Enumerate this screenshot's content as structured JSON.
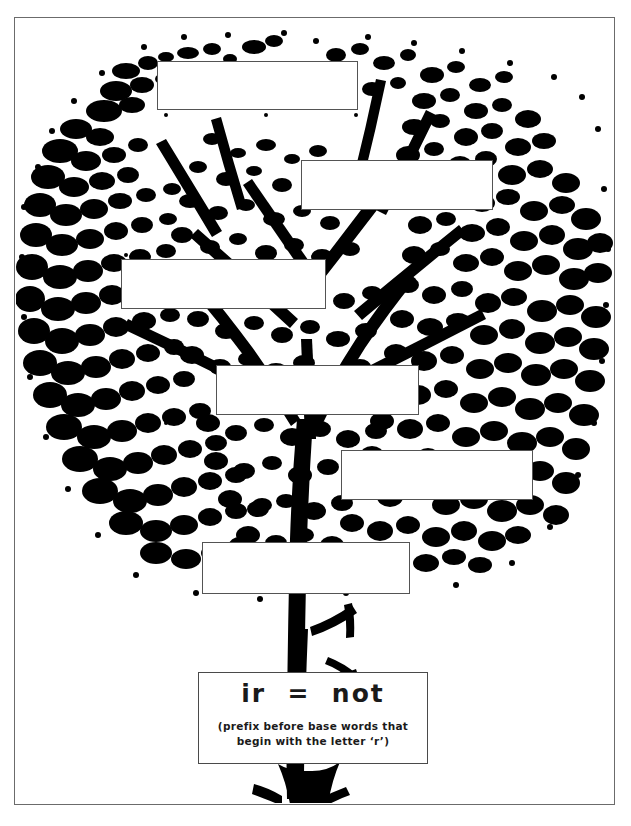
{
  "page": {
    "background_color": "#ffffff",
    "border_color": "#6b6b6b",
    "ink_color": "#000000"
  },
  "artwork": {
    "name": "tree-illustration",
    "description": "high contrast black and white tree with full canopy and trunk",
    "color": "#000000"
  },
  "answer_boxes": [
    {
      "id": "answer-box-1",
      "label": "",
      "left": 157,
      "top": 61,
      "width": 201,
      "height": 49
    },
    {
      "id": "answer-box-2",
      "label": "",
      "left": 301,
      "top": 160,
      "width": 192,
      "height": 50
    },
    {
      "id": "answer-box-3",
      "label": "",
      "left": 121,
      "top": 259,
      "width": 205,
      "height": 50
    },
    {
      "id": "answer-box-4",
      "label": "",
      "left": 216,
      "top": 365,
      "width": 203,
      "height": 50
    },
    {
      "id": "answer-box-5",
      "label": "",
      "left": 341,
      "top": 450,
      "width": 192,
      "height": 50
    },
    {
      "id": "answer-box-6",
      "label": "",
      "left": 202,
      "top": 542,
      "width": 208,
      "height": 52
    }
  ],
  "definition": {
    "title": "ir  =  not",
    "subtitle_line_1": "(prefix before base words that",
    "subtitle_line_2": "begin with the letter ‘r’)"
  }
}
